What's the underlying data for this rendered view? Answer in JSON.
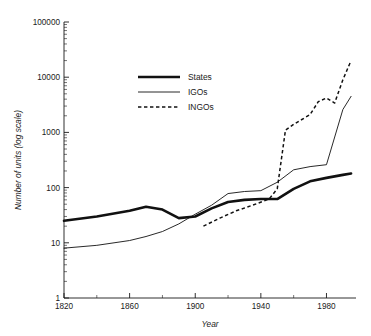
{
  "header": {
    "clipped_text": ""
  },
  "chart_data": {
    "type": "line",
    "title": "",
    "xlabel": "Year",
    "ylabel": "Number of units (log scale)",
    "xlim": [
      1820,
      1998
    ],
    "ylim": [
      1,
      100000
    ],
    "yscale": "log",
    "grid": false,
    "legend_position": "upper-left-inset",
    "xticks": [
      1820,
      1860,
      1900,
      1940,
      1980
    ],
    "xtick_labels": [
      "1820",
      "1860",
      "1900",
      "1940",
      "1980"
    ],
    "yticks": [
      1,
      10,
      100,
      1000,
      10000,
      100000
    ],
    "ytick_labels": [
      "1",
      "10",
      "100",
      "1000",
      "10000",
      "100000"
    ],
    "series": [
      {
        "name": "States",
        "style": "thick-solid",
        "x": [
          1820,
          1840,
          1860,
          1870,
          1880,
          1890,
          1900,
          1910,
          1920,
          1930,
          1940,
          1950,
          1960,
          1970,
          1980,
          1990,
          1995
        ],
        "values": [
          25,
          30,
          38,
          45,
          40,
          28,
          30,
          42,
          55,
          60,
          62,
          62,
          95,
          130,
          150,
          170,
          180
        ]
      },
      {
        "name": "IGOs",
        "style": "thin-solid",
        "x": [
          1820,
          1840,
          1860,
          1870,
          1880,
          1890,
          1900,
          1910,
          1920,
          1930,
          1940,
          1950,
          1960,
          1970,
          1980,
          1990,
          1995
        ],
        "values": [
          8,
          9,
          11,
          13,
          16,
          22,
          33,
          48,
          78,
          85,
          88,
          125,
          210,
          240,
          260,
          2600,
          4500
        ]
      },
      {
        "name": "INGOs",
        "style": "dashed",
        "x": [
          1905,
          1915,
          1925,
          1935,
          1945,
          1950,
          1955,
          1960,
          1970,
          1975,
          1980,
          1985,
          1990,
          1995
        ],
        "values": [
          20,
          28,
          38,
          48,
          62,
          95,
          1100,
          1400,
          2100,
          3600,
          4200,
          3400,
          9000,
          20000
        ]
      }
    ]
  },
  "legend": {
    "items": [
      {
        "label": "States"
      },
      {
        "label": "IGOs"
      },
      {
        "label": "INGOs"
      }
    ]
  }
}
